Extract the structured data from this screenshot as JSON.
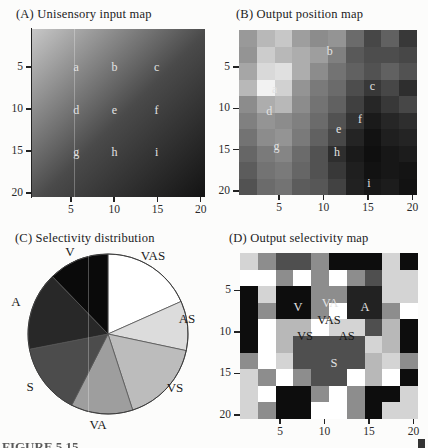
{
  "caption": {
    "label": "FIGURE 5.15"
  },
  "chart_data": [
    {
      "id": "A",
      "type": "heatmap",
      "subtype": "smooth-gradient",
      "title": "(A)  Unisensory input map",
      "x_ticks": [
        5,
        10,
        15,
        20
      ],
      "y_ticks": [
        5,
        10,
        15,
        20
      ],
      "axis_range": [
        1,
        20
      ],
      "y_axis_direction": "downward",
      "gradient": {
        "from": "#c7c7c7",
        "mid": "#4a4a4a",
        "to": "#131313",
        "direction_deg": 135
      },
      "markers": [
        {
          "label": "a",
          "fx": 0.256,
          "fy": 0.228
        },
        {
          "label": "b",
          "fx": 0.477,
          "fy": 0.228
        },
        {
          "label": "c",
          "fx": 0.72,
          "fy": 0.228
        },
        {
          "label": "d",
          "fx": 0.256,
          "fy": 0.48
        },
        {
          "label": "e",
          "fx": 0.477,
          "fy": 0.48
        },
        {
          "label": "f",
          "fx": 0.72,
          "fy": 0.48
        },
        {
          "label": "g",
          "fx": 0.256,
          "fy": 0.73
        },
        {
          "label": "h",
          "fx": 0.477,
          "fy": 0.73
        },
        {
          "label": "i",
          "fx": 0.72,
          "fy": 0.73
        }
      ]
    },
    {
      "id": "B",
      "type": "heatmap",
      "subtype": "blocky",
      "title": "(B)  Output position map",
      "x_ticks": [
        5,
        10,
        15,
        20
      ],
      "y_ticks": [
        5,
        10,
        15,
        20
      ],
      "axis_range": [
        1,
        20
      ],
      "y_axis_direction": "downward",
      "values": [
        [
          0.6,
          0.72,
          0.78,
          0.62,
          0.55,
          0.58,
          0.42,
          0.28,
          0.38,
          0.22
        ],
        [
          0.58,
          0.8,
          0.72,
          0.68,
          0.62,
          0.5,
          0.35,
          0.3,
          0.3,
          0.28
        ],
        [
          0.65,
          0.85,
          0.88,
          0.68,
          0.55,
          0.45,
          0.38,
          0.32,
          0.38,
          0.32
        ],
        [
          0.72,
          0.95,
          0.82,
          0.58,
          0.48,
          0.42,
          0.3,
          0.22,
          0.28,
          0.18
        ],
        [
          0.55,
          0.68,
          0.72,
          0.55,
          0.45,
          0.38,
          0.25,
          0.15,
          0.22,
          0.28
        ],
        [
          0.5,
          0.58,
          0.55,
          0.5,
          0.42,
          0.32,
          0.2,
          0.1,
          0.15,
          0.18
        ],
        [
          0.45,
          0.55,
          0.58,
          0.48,
          0.38,
          0.28,
          0.14,
          0.07,
          0.12,
          0.14
        ],
        [
          0.4,
          0.48,
          0.52,
          0.42,
          0.32,
          0.18,
          0.1,
          0.06,
          0.09,
          0.11
        ],
        [
          0.36,
          0.45,
          0.48,
          0.4,
          0.32,
          0.22,
          0.12,
          0.07,
          0.09,
          0.08
        ],
        [
          0.32,
          0.42,
          0.45,
          0.36,
          0.34,
          0.26,
          0.13,
          0.09,
          0.11,
          0.07
        ]
      ],
      "markers": [
        {
          "label": "a",
          "fx": 0.2,
          "fy": 0.36
        },
        {
          "label": "b",
          "fx": 0.51,
          "fy": 0.13
        },
        {
          "label": "c",
          "fx": 0.75,
          "fy": 0.34
        },
        {
          "label": "d",
          "fx": 0.17,
          "fy": 0.49
        },
        {
          "label": "e",
          "fx": 0.56,
          "fy": 0.6
        },
        {
          "label": "f",
          "fx": 0.68,
          "fy": 0.54
        },
        {
          "label": "g",
          "fx": 0.21,
          "fy": 0.7
        },
        {
          "label": "h",
          "fx": 0.55,
          "fy": 0.74
        },
        {
          "label": "i",
          "fx": 0.73,
          "fy": 0.93
        }
      ]
    },
    {
      "id": "C",
      "type": "pie",
      "title": "(C)  Selectivity distribution",
      "rotation": "clockwise-from-north",
      "slices": [
        {
          "label": "VAS",
          "start_deg": 0,
          "end_deg": 66,
          "percent": 18.3,
          "color": "#ffffff"
        },
        {
          "label": "AS",
          "start_deg": 66,
          "end_deg": 102,
          "percent": 10.0,
          "color": "#dcdcdc"
        },
        {
          "label": "VS",
          "start_deg": 102,
          "end_deg": 162,
          "percent": 16.7,
          "color": "#bcbcbc"
        },
        {
          "label": "VA",
          "start_deg": 162,
          "end_deg": 207,
          "percent": 12.5,
          "color": "#9e9e9e"
        },
        {
          "label": "S",
          "start_deg": 207,
          "end_deg": 259,
          "percent": 14.4,
          "color": "#4c4c4c"
        },
        {
          "label": "A",
          "start_deg": 259,
          "end_deg": 316,
          "percent": 15.9,
          "color": "#282828"
        },
        {
          "label": "V",
          "start_deg": 316,
          "end_deg": 360,
          "percent": 12.2,
          "color": "#0a0a0a"
        }
      ],
      "labels": [
        {
          "text": "V",
          "x": 70,
          "y": 27
        },
        {
          "text": "VAS",
          "x": 153,
          "y": 31
        },
        {
          "text": "AS",
          "x": 187,
          "y": 94
        },
        {
          "text": "VS",
          "x": 175,
          "y": 163
        },
        {
          "text": "VA",
          "x": 98,
          "y": 200
        },
        {
          "text": "S",
          "x": 30,
          "y": 162
        },
        {
          "text": "A",
          "x": 16,
          "y": 77
        }
      ]
    },
    {
      "id": "D",
      "type": "heatmap",
      "subtype": "categorical",
      "title": "(D)  Output selectivity map",
      "x_ticks": [
        5,
        10,
        15,
        20
      ],
      "y_ticks": [
        5,
        10,
        15,
        20
      ],
      "axis_range": [
        1,
        20
      ],
      "y_axis_direction": "downward",
      "category_colors": {
        "V": "#0d0d0d",
        "A": "#222222",
        "S": "#4f4f4f",
        "VA": "#8d8d8d",
        "VS": "#b8b8b8",
        "AS": "#d4d4d4",
        "VAS": "#ffffff"
      },
      "grid": [
        [
          "AS",
          "VA",
          "S",
          "S",
          "VA",
          "V",
          "V",
          "V",
          "AS",
          "V"
        ],
        [
          "VAS",
          "VAS",
          "VA",
          "VAS",
          "VA",
          "VAS",
          "VA",
          "S",
          "AS",
          "AS"
        ],
        [
          "V",
          "AS",
          "V",
          "V",
          "VA",
          "VA",
          "A",
          "A",
          "AS",
          "AS"
        ],
        [
          "V",
          "VA",
          "V",
          "V",
          "VA",
          "VAS",
          "A",
          "A",
          "VA",
          "VAS"
        ],
        [
          "V",
          "VAS",
          "VS",
          "VS",
          "VAS",
          "AS",
          "AS",
          "S",
          "VS",
          "V"
        ],
        [
          "V",
          "VAS",
          "VS",
          "S",
          "S",
          "S",
          "S",
          "AS",
          "VS",
          "V"
        ],
        [
          "VA",
          "VAS",
          "AS",
          "S",
          "S",
          "S",
          "S",
          "VS",
          "AS",
          "VA"
        ],
        [
          "AS",
          "VA",
          "VAS",
          "VA",
          "S",
          "S",
          "VAS",
          "VS",
          "VAS",
          "V"
        ],
        [
          "AS",
          "VAS",
          "V",
          "V",
          "VA",
          "VAS",
          "VA",
          "V",
          "V",
          "AS"
        ],
        [
          "AS",
          "VA",
          "V",
          "V",
          "VAS",
          "VAS",
          "VA",
          "V",
          "AS",
          "AS"
        ]
      ],
      "region_labels": [
        {
          "text": "V",
          "fx": 0.326,
          "fy": 0.325,
          "tone": "light"
        },
        {
          "text": "VA",
          "fx": 0.506,
          "fy": 0.301,
          "tone": "light"
        },
        {
          "text": "A",
          "fx": 0.702,
          "fy": 0.325,
          "tone": "light"
        },
        {
          "text": "VAS",
          "fx": 0.5,
          "fy": 0.404,
          "tone": "dark"
        },
        {
          "text": "VS",
          "fx": 0.365,
          "fy": 0.5,
          "tone": "dark"
        },
        {
          "text": "AS",
          "fx": 0.6,
          "fy": 0.5,
          "tone": "dark"
        },
        {
          "text": "S",
          "fx": 0.528,
          "fy": 0.663,
          "tone": "light"
        }
      ]
    }
  ]
}
